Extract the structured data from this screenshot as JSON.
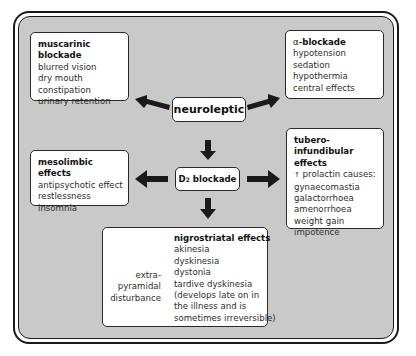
{
  "center": {
    "top_node": "neuroleptic",
    "middle_node_prefix": "D",
    "middle_node_sub": "2",
    "middle_node_suffix": " blockade"
  },
  "boxes": {
    "muscarinic": {
      "title": "muscarinic blockade",
      "items": [
        "blurred vision",
        "dry mouth",
        "constipation",
        "urinary retention"
      ]
    },
    "alpha": {
      "title_prefix": "α",
      "title": "-blockade",
      "items": [
        "hypotension",
        "sedation",
        "hypothermia",
        "central effects"
      ]
    },
    "mesolimbic": {
      "title": "mesolimbic effects",
      "items": [
        "antipsychotic effect",
        "restlessness",
        "insomnia"
      ]
    },
    "tubero": {
      "title_line1": "tubero-infundibular",
      "title_line2": "effects",
      "arrow_glyph": "↑",
      "intro": "prolactin causes:",
      "items": [
        "gynaecomastia",
        "galactorrhoea",
        "amenorrhoea",
        "weight gain",
        "impotence"
      ]
    },
    "nigrostriatal": {
      "title": "nigrostriatal effects",
      "items": [
        "akinesia",
        "dyskinesia",
        "dystonia",
        "tardive dyskinesia",
        "(develops late on in",
        "the illness and is",
        "sometimes irreversible)"
      ],
      "bracket_label": [
        "extra-",
        "pyramidal",
        "disturbance"
      ]
    }
  },
  "colors": {
    "background": "#c9c9c9",
    "box_fill": "#ffffff",
    "arrow": "#1a1a1a"
  }
}
